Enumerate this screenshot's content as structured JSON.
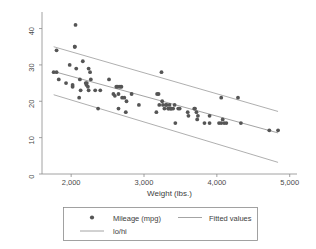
{
  "chart_data": {
    "type": "scatter",
    "title": "",
    "xlabel": "Weight (lbs.)",
    "ylabel": "",
    "xlim": [
      1600,
      5100
    ],
    "ylim": [
      0,
      44
    ],
    "xticks": [
      2000,
      3000,
      4000,
      5000
    ],
    "xticklabels": [
      "2,000",
      "3,000",
      "4,000",
      "5,000"
    ],
    "yticks": [
      0,
      10,
      20,
      30,
      40
    ],
    "yticklabels": [
      "0",
      "10",
      "20",
      "30",
      "40"
    ],
    "grid": false,
    "legend_position": "below-plot",
    "series": [
      {
        "name": "Mileage (mpg)",
        "marker": "circle",
        "color": "#555555",
        "points": [
          [
            1760,
            28
          ],
          [
            1800,
            28
          ],
          [
            1800,
            34
          ],
          [
            1830,
            26
          ],
          [
            1930,
            25
          ],
          [
            1980,
            30
          ],
          [
            2020,
            24
          ],
          [
            2020,
            24.5
          ],
          [
            2050,
            35
          ],
          [
            2050,
            35
          ],
          [
            2060,
            41
          ],
          [
            2070,
            29
          ],
          [
            2110,
            21
          ],
          [
            2120,
            26
          ],
          [
            2130,
            23
          ],
          [
            2160,
            31
          ],
          [
            2200,
            25
          ],
          [
            2210,
            24.5
          ],
          [
            2215,
            25
          ],
          [
            2230,
            24
          ],
          [
            2240,
            23
          ],
          [
            2240,
            29
          ],
          [
            2260,
            28
          ],
          [
            2270,
            26
          ],
          [
            2330,
            23
          ],
          [
            2370,
            18
          ],
          [
            2400,
            23
          ],
          [
            2520,
            26
          ],
          [
            2580,
            22
          ],
          [
            2600,
            21.5
          ],
          [
            2620,
            24
          ],
          [
            2640,
            24
          ],
          [
            2650,
            18
          ],
          [
            2650,
            22
          ],
          [
            2670,
            24
          ],
          [
            2690,
            24
          ],
          [
            2700,
            21
          ],
          [
            2730,
            21
          ],
          [
            2750,
            17
          ],
          [
            2760,
            20
          ],
          [
            2830,
            22
          ],
          [
            2930,
            19
          ],
          [
            3170,
            17
          ],
          [
            3180,
            22
          ],
          [
            3200,
            22
          ],
          [
            3210,
            19
          ],
          [
            3240,
            28
          ],
          [
            3250,
            20
          ],
          [
            3260,
            19
          ],
          [
            3280,
            18
          ],
          [
            3300,
            19
          ],
          [
            3310,
            19
          ],
          [
            3330,
            18
          ],
          [
            3340,
            18
          ],
          [
            3350,
            19
          ],
          [
            3360,
            18
          ],
          [
            3370,
            18
          ],
          [
            3380,
            18
          ],
          [
            3400,
            18
          ],
          [
            3420,
            19
          ],
          [
            3430,
            14
          ],
          [
            3470,
            18
          ],
          [
            3490,
            18
          ],
          [
            3600,
            17
          ],
          [
            3610,
            16
          ],
          [
            3690,
            18
          ],
          [
            3700,
            18
          ],
          [
            3720,
            17
          ],
          [
            3730,
            15
          ],
          [
            3740,
            16
          ],
          [
            3830,
            14
          ],
          [
            3900,
            14
          ],
          [
            3900,
            16
          ],
          [
            4030,
            14
          ],
          [
            4060,
            21
          ],
          [
            4060,
            14
          ],
          [
            4080,
            15
          ],
          [
            4100,
            14
          ],
          [
            4130,
            14
          ],
          [
            4290,
            21
          ],
          [
            4330,
            14
          ],
          [
            4720,
            12
          ],
          [
            4840,
            12
          ]
        ]
      }
    ],
    "lines": [
      {
        "name": "Fitted values",
        "color": "#8c8c8c",
        "x": [
          1760,
          4840
        ],
        "y": [
          28.2,
          11.3
        ]
      },
      {
        "name": "lo",
        "color": "#9a9a9a",
        "x": [
          1760,
          4840
        ],
        "y": [
          21.8,
          3.2
        ]
      },
      {
        "name": "hi",
        "color": "#9a9a9a",
        "x": [
          1760,
          4840
        ],
        "y": [
          35.0,
          17.2
        ]
      }
    ]
  },
  "legend": {
    "entries": [
      {
        "label": "Mileage (mpg)",
        "type": "marker"
      },
      {
        "label": "Fitted values",
        "type": "line"
      },
      {
        "label": "lo/hi",
        "type": "line"
      }
    ]
  }
}
